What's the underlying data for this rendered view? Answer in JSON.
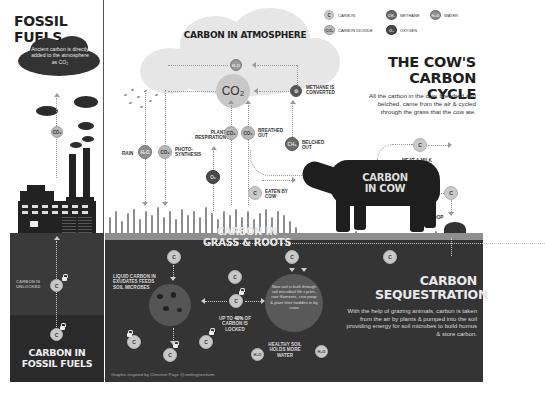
{
  "fossil": {
    "title": "FOSSIL FUELS",
    "cloud_text": "Ancient carbon is directly added to the atmosphere as CO₂",
    "co2_label": "CO₂",
    "unlocked_label": "CARBON IS UNLOCKED",
    "c_label": "C",
    "bottom_title_1": "CARBON IN",
    "bottom_title_2": "FOSSIL FUELS"
  },
  "legend": {
    "items": [
      {
        "symbol": "C",
        "label": "CARBON"
      },
      {
        "symbol": "CH₄",
        "label": "METHANE"
      },
      {
        "symbol": "H₂O",
        "label": "WATER"
      },
      {
        "symbol": "CO₂",
        "label": "CARBON DIOXIDE"
      },
      {
        "symbol": "O₂",
        "label": "OXYGEN"
      }
    ]
  },
  "atmosphere": {
    "title": "CARBON IN ATMOSPHERE",
    "h2o": "H₂O",
    "co2": "CO₂",
    "methane_label": "METHANE IS CONVERTED"
  },
  "cow_cycle": {
    "title_1": "THE COW'S",
    "title_2": "CARBON CYCLE",
    "description": "All the carbon in the cow, breathed and belched, came from the air & cycled through the grass that the cow ate."
  },
  "flows": {
    "rain": "RAIN",
    "rain_sym": "H₂O",
    "photo_sym": "CO₂",
    "photo_label": "PHOTO-SYNTHESIS",
    "plant_resp_label": "PLANT RESPIRATION",
    "plant_resp_sym": "CO₂",
    "breathed_sym": "CO₂",
    "breathed_label": "BREATHED OUT",
    "o2_sym": "O₂",
    "belched_sym": "CH₄",
    "belched_label": "BELCHED OUT",
    "eaten_sym": "C",
    "eaten_label": "EATEN BY COW",
    "meat_sym": "C",
    "meat_label": "MEAT & MILK",
    "poop_sym": "C",
    "poop_label": "POOP"
  },
  "cow": {
    "title_1": "CARBON",
    "title_2": "IN COW"
  },
  "grass": {
    "title_1": "CARBON IN",
    "title_2": "GRASS & ROOTS"
  },
  "soil": {
    "c_sym": "C",
    "liquid_label": "LIQUID CARBON IN EXUDATES FEEDS SOIL MICROBES",
    "locked_pre": "UP TO ",
    "locked_pct": "40%",
    "locked_post": " OF CARBON IS LOCKED",
    "new_soil_text": "New soil is built through soil microbial life cycles, root filaments, cow poop & plant litter trodden in by cows",
    "healthy_label": "HEALTHY SOIL HOLDS MORE WATER",
    "h2o_sym": "H₂O",
    "credit": "Graphic inspired by Christine Page @smilingtreefarm"
  },
  "sequestration": {
    "title_1": "CARBON",
    "title_2": "SEQUESTRATION",
    "description": "With the help of grazing animals, carbon is taken from the air by plants & pumped into the soil providing energy for soil microbes to build humus & store carbon."
  },
  "colors": {
    "soil_dark": "#2f2f2f",
    "soil_mid": "#3a3a3a",
    "grass": "#8e8e8e",
    "cloud": "#e6e6e6",
    "ink": "#1e1e1e"
  }
}
